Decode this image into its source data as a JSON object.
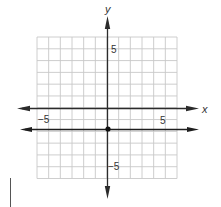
{
  "diagram": {
    "type": "coordinate-plane",
    "axes": {
      "x_label": "x",
      "y_label": "y"
    },
    "tick_labels": {
      "x_negative": "−5",
      "x_positive": "5",
      "y_positive": "5",
      "y_negative": "−5"
    },
    "grid": {
      "columns": 12,
      "rows": 12,
      "x_range": [
        -6,
        6
      ],
      "y_range": [
        -6,
        6
      ]
    },
    "graphed_line": {
      "description": "horizontal line",
      "equation": "y = -2",
      "point": {
        "x": 0,
        "y": -2
      }
    },
    "colors": {
      "grid": "#c8c8c8",
      "axis": "#2b2b2b",
      "line": "#1e1e1e",
      "point": "#111111"
    }
  }
}
